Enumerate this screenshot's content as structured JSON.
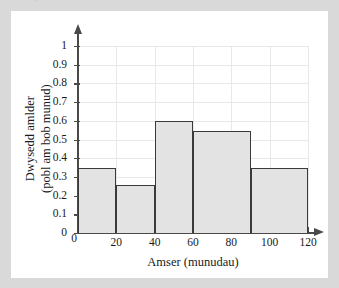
{
  "top_strip": {
    "ghost_text": "."
  },
  "chart_data": {
    "type": "bar",
    "title": "",
    "subtitle": "",
    "xlabel": "Amser (munudau)",
    "ylabel_line1": "Dwysedd amlder",
    "ylabel_line2": "(pobl am bob munud)",
    "ylabel": "Dwysedd amlder (pobl am bob munud)",
    "grid": true,
    "legend": "none",
    "xlim": [
      0,
      120
    ],
    "ylim": [
      0,
      1
    ],
    "xticks": [
      0,
      20,
      40,
      60,
      80,
      100,
      120
    ],
    "xtick_labels": [
      "0",
      "20",
      "40",
      "60",
      "80",
      "100",
      "120"
    ],
    "yticks": [
      0,
      0.1,
      0.2,
      0.3,
      0.4,
      0.5,
      0.6,
      0.7,
      0.8,
      0.9,
      1
    ],
    "ytick_labels": [
      "0",
      "0.1",
      "0.2",
      "0.3",
      "0.4",
      "0.5",
      "0.6",
      "0.7",
      "0.8",
      "0.9",
      "1"
    ],
    "bin_edges": [
      0,
      20,
      40,
      60,
      90,
      120
    ],
    "categories": [
      "0-20",
      "20-40",
      "40-60",
      "60-90",
      "90-120"
    ],
    "values": [
      0.35,
      0.255,
      0.6,
      0.545,
      0.35
    ],
    "bars": [
      {
        "x0": 0,
        "x1": 20,
        "height": 0.35
      },
      {
        "x0": 20,
        "x1": 40,
        "height": 0.255
      },
      {
        "x0": 40,
        "x1": 60,
        "height": 0.6
      },
      {
        "x0": 60,
        "x1": 90,
        "height": 0.545
      },
      {
        "x0": 90,
        "x1": 120,
        "height": 0.35
      }
    ]
  },
  "style": {
    "page_background": "#d9d9d9",
    "panel_background": "#ffffff",
    "bar_fill": "#e3e3e3",
    "bar_stroke": "#3a3a3a",
    "axis_color": "#4a4a4a",
    "grid_color": "#e8e8e8",
    "text_color": "#1a1a1a"
  }
}
